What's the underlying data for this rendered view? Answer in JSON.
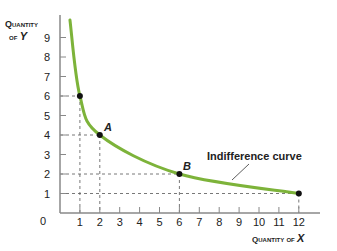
{
  "chart_data": {
    "type": "line",
    "title": "",
    "xlabel": "Quantity of X",
    "ylabel": "Quantity of Y",
    "xlim": [
      0,
      13
    ],
    "ylim": [
      0,
      10
    ],
    "x_ticks": [
      1,
      2,
      3,
      4,
      5,
      6,
      7,
      8,
      9,
      10,
      11,
      12
    ],
    "y_ticks": [
      1,
      2,
      3,
      4,
      5,
      6,
      7,
      8,
      9
    ],
    "origin_label": "0",
    "grid": false,
    "series": [
      {
        "name": "Indifference curve",
        "color": "#7db33a",
        "x": [
          0.5,
          1,
          2,
          6,
          12
        ],
        "y": [
          9.9,
          6,
          4,
          2,
          1
        ]
      }
    ],
    "points": [
      {
        "x": 1,
        "y": 6,
        "label": ""
      },
      {
        "x": 2,
        "y": 4,
        "label": "A"
      },
      {
        "x": 6,
        "y": 2,
        "label": "B"
      },
      {
        "x": 12,
        "y": 1,
        "label": ""
      }
    ],
    "annotations": [
      {
        "text": "Indifference curve",
        "points_to": "curve"
      }
    ]
  },
  "labels": {
    "y_axis_line1": "Quantity",
    "y_axis_line2_prefix": "of ",
    "y_axis_var": "Y",
    "x_axis_prefix": "Quantity of ",
    "x_axis_var": "X",
    "origin": "0",
    "point_a": "A",
    "point_b": "B",
    "curve_label": "Indifference curve"
  },
  "colors": {
    "curve": "#7db33a",
    "axis": "#888888",
    "text": "#222222"
  }
}
